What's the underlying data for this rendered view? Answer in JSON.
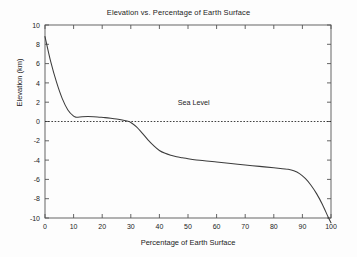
{
  "chart_data": {
    "type": "line",
    "title": "Elevation vs. Percentage of Earth Surface",
    "xlabel": "Percentage of Earth Surface",
    "ylabel": "Elevation (km)",
    "xlim": [
      0,
      100
    ],
    "ylim": [
      -10,
      10
    ],
    "xticks": [
      0,
      10,
      20,
      30,
      40,
      50,
      60,
      70,
      80,
      90,
      100
    ],
    "yticks": [
      10,
      8,
      6,
      4,
      2,
      0,
      -2,
      -4,
      -6,
      -8,
      -10
    ],
    "xtick_labels": [
      "0",
      "10",
      "20",
      "30",
      "40",
      "50",
      "60",
      "70",
      "80",
      "90",
      "100"
    ],
    "ytick_labels": [
      "10",
      "8",
      "6",
      "4",
      "2",
      "0",
      "-2",
      "-4",
      "-6",
      "-8",
      "-10"
    ],
    "grid": false,
    "legend": false,
    "series": [
      {
        "name": "Hypsographic curve",
        "color": "#3c3c3c",
        "x": [
          0,
          2,
          4,
          6,
          8,
          10,
          11,
          13,
          15,
          17,
          19,
          21,
          23,
          25,
          27,
          29,
          30,
          32,
          34,
          36,
          38,
          40,
          42,
          44,
          46,
          48,
          50,
          55,
          60,
          65,
          70,
          75,
          80,
          83,
          85,
          87,
          89,
          91,
          93,
          95,
          97,
          99,
          100
        ],
        "y": [
          8.8,
          6.2,
          4.1,
          2.4,
          1.2,
          0.55,
          0.45,
          0.5,
          0.52,
          0.5,
          0.45,
          0.4,
          0.33,
          0.25,
          0.15,
          0.02,
          -0.1,
          -0.55,
          -1.2,
          -1.9,
          -2.5,
          -3.0,
          -3.3,
          -3.5,
          -3.65,
          -3.75,
          -3.85,
          -4.05,
          -4.2,
          -4.35,
          -4.5,
          -4.65,
          -4.8,
          -4.9,
          -4.95,
          -5.1,
          -5.4,
          -5.9,
          -6.6,
          -7.5,
          -8.6,
          -9.9,
          -10.5
        ]
      }
    ],
    "reference_lines": [
      {
        "name": "sea-level",
        "label": "Sea Level",
        "value": 0,
        "orientation": "horizontal",
        "style": "dotted",
        "color": "#2b2b2b",
        "label_x": 52,
        "label_y": 1.7
      }
    ]
  }
}
